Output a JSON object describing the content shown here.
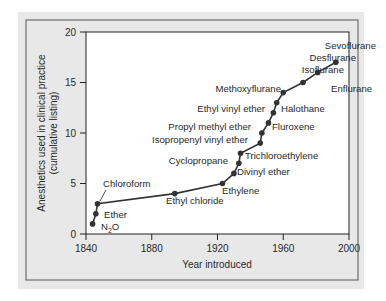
{
  "colors": {
    "panel_bg": "#e8e8e8",
    "frame_border": "#555555",
    "plot_bg": "#ffffff",
    "line": "#333333",
    "marker": "#333333",
    "text": "#2a2a2a"
  },
  "chart_data": {
    "type": "line",
    "title": "",
    "xlabel": "Year introduced",
    "ylabel": "Anesthetics used in clinical practice (cumulative listing)",
    "ylabel_lines": [
      "Anesthetics used in clinical practice",
      "(cumulative listing)"
    ],
    "xlim": [
      1840,
      2000
    ],
    "ylim": [
      0,
      20
    ],
    "xticks": [
      1840,
      1880,
      1920,
      1960,
      2000
    ],
    "yticks": [
      0,
      5,
      10,
      15,
      20
    ],
    "grid": false,
    "legend": null,
    "series": [
      {
        "name": "Anesthetics (cumulative)",
        "points": [
          {
            "x": 1844,
            "y": 1,
            "label": "N2O"
          },
          {
            "x": 1846,
            "y": 2,
            "label": "Ether"
          },
          {
            "x": 1847,
            "y": 3,
            "label": "Chloroform"
          },
          {
            "x": 1894,
            "y": 4,
            "label": "Ethyl chloride"
          },
          {
            "x": 1923,
            "y": 5,
            "label": "Ethylene"
          },
          {
            "x": 1930,
            "y": 6,
            "label": "Divinyl ether"
          },
          {
            "x": 1933,
            "y": 7,
            "label": "Cyclopropane"
          },
          {
            "x": 1934,
            "y": 8,
            "label": "Trichloroethylene"
          },
          {
            "x": 1946,
            "y": 9,
            "label": "Isopropenyl vinyl ether"
          },
          {
            "x": 1947,
            "y": 10,
            "label": "Propyl methyl ether"
          },
          {
            "x": 1951,
            "y": 11,
            "label": "Fluroxene"
          },
          {
            "x": 1954,
            "y": 12,
            "label": "Ethyl vinyl ether"
          },
          {
            "x": 1956,
            "y": 13,
            "label": "Halothane"
          },
          {
            "x": 1960,
            "y": 14,
            "label": "Methoxyflurane"
          },
          {
            "x": 1972,
            "y": 15,
            "label": "Enflurane"
          },
          {
            "x": 1981,
            "y": 16,
            "label": "Isoflurane"
          },
          {
            "x": 1992,
            "y": 17,
            "label": "Desflurane / Sevoflurane"
          }
        ]
      }
    ],
    "annotations": [
      {
        "text": "Sevoflurane",
        "x_px": 376,
        "y_px": 49,
        "anchor": "end"
      },
      {
        "text": "Desflurane",
        "x_px": 356,
        "y_px": 61,
        "anchor": "end"
      },
      {
        "text": "Isoflurane",
        "x_px": 344,
        "y_px": 73,
        "anchor": "end"
      },
      {
        "text": "Enflurane",
        "x_px": 331,
        "y_px": 92,
        "anchor": "start"
      },
      {
        "text": "Methoxyflurane",
        "x_px": 281,
        "y_px": 92,
        "anchor": "end"
      },
      {
        "text": "Halothane",
        "x_px": 281,
        "y_px": 112,
        "anchor": "start"
      },
      {
        "text": "Ethyl vinyl ether",
        "x_px": 265,
        "y_px": 112,
        "anchor": "end"
      },
      {
        "text": "Fluroxene",
        "x_px": 272,
        "y_px": 130,
        "anchor": "start"
      },
      {
        "text": "Propyl methyl ether",
        "x_px": 251,
        "y_px": 130,
        "anchor": "end"
      },
      {
        "text": "Isopropenyl vinyl ether",
        "x_px": 248,
        "y_px": 143,
        "anchor": "end"
      },
      {
        "text": "Trichloroethylene",
        "x_px": 245,
        "y_px": 159,
        "anchor": "start"
      },
      {
        "text": "Cyclopropane",
        "x_px": 228,
        "y_px": 164,
        "anchor": "end"
      },
      {
        "text": "Divinyl ether",
        "x_px": 237,
        "y_px": 175,
        "anchor": "start"
      },
      {
        "text": "Ethylene",
        "x_px": 222,
        "y_px": 194,
        "anchor": "start"
      },
      {
        "text": "Ethyl chloride",
        "x_px": 166,
        "y_px": 204,
        "anchor": "start"
      },
      {
        "text": "Chloroform",
        "x_px": 103,
        "y_px": 187,
        "anchor": "start"
      },
      {
        "text": "Ether",
        "x_px": 104,
        "y_px": 218,
        "anchor": "start"
      },
      {
        "text": "N2O",
        "x_px": 101,
        "y_px": 230,
        "anchor": "start"
      }
    ]
  }
}
